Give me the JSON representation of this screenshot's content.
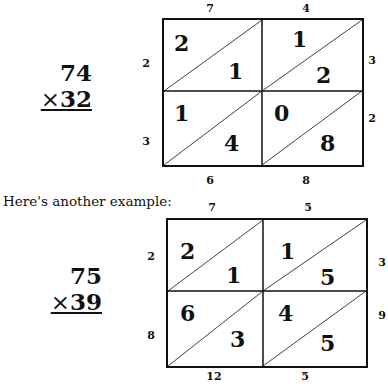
{
  "example1": {
    "multiplicand": "74",
    "multiplier_sign": "×",
    "multiplier": "32",
    "top_labels": [
      "7",
      "4"
    ],
    "right_labels": [
      "3",
      "2"
    ],
    "left_labels": [
      "2",
      "3"
    ],
    "bottom_labels": [
      "6",
      "8"
    ],
    "cells": [
      {
        "tens": "2",
        "ones": "1"
      },
      {
        "tens": "1",
        "ones": "2"
      },
      {
        "tens": "1",
        "ones": "4"
      },
      {
        "tens": "0",
        "ones": "8"
      }
    ]
  },
  "caption": "Here's another example:",
  "example2": {
    "multiplicand": "75",
    "multiplier_sign": "×",
    "multiplier": "39",
    "top_labels": [
      "7",
      "5"
    ],
    "right_labels": [
      "3",
      "9"
    ],
    "left_labels": [
      "2",
      "8"
    ],
    "bottom_labels": [
      "12",
      "5"
    ],
    "cells": [
      {
        "tens": "2",
        "ones": "1"
      },
      {
        "tens": "1",
        "ones": "5"
      },
      {
        "tens": "6",
        "ones": "3"
      },
      {
        "tens": "4",
        "ones": "5"
      }
    ]
  }
}
